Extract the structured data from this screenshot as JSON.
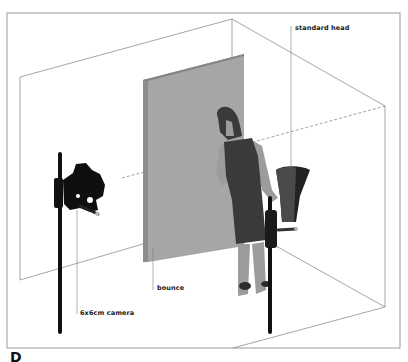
{
  "figure": {
    "letter": "D",
    "labels": {
      "standard_head": "standard head",
      "bounce": "bounce",
      "camera": "6x6cm camera"
    },
    "colors": {
      "frame": "#9a9a9a",
      "room_lines": "#6a6a6a",
      "bounce_board": "#a8a8a8",
      "bounce_edge": "#8c8c8c",
      "dress": "#3a3a3a",
      "skin": "#9c9c9c",
      "equipment": "#111111"
    }
  }
}
